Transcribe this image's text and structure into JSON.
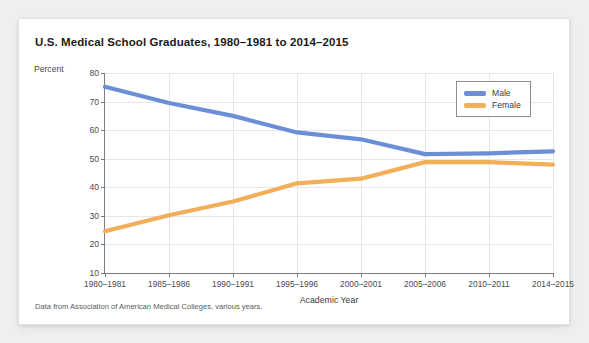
{
  "card": {
    "title": "U.S. Medical School Graduates, 1980–1981 to 2014–2015",
    "source_note": "Data from Association of American Medical Colleges, various years."
  },
  "chart_data": {
    "type": "line",
    "title": "U.S. Medical School Graduates, 1980–1981 to 2014–2015",
    "xlabel": "Academic Year",
    "ylabel": "Percent",
    "categories": [
      "1980–1981",
      "1985–1986",
      "1990–1991",
      "1995–1996",
      "2000–2001",
      "2005–2006",
      "2010–2011",
      "2014–2015"
    ],
    "series": [
      {
        "name": "Male",
        "color": "#6b8ed6",
        "values": [
          75.2,
          69.5,
          65.0,
          59.2,
          56.8,
          51.6,
          51.9,
          52.6
        ]
      },
      {
        "name": "Female",
        "color": "#f2ae58",
        "values": [
          24.6,
          30.2,
          35.0,
          41.4,
          43.0,
          48.8,
          48.8,
          47.9
        ]
      }
    ],
    "ylim": [
      10,
      80
    ],
    "yticks": [
      80,
      70,
      60,
      50,
      40,
      30,
      20,
      10
    ],
    "ytick_labels": [
      "80",
      "70",
      "60",
      "50",
      "40",
      "30",
      "20",
      "10"
    ],
    "grid": true,
    "legend_position": "top-right",
    "legend_entries": [
      "Male",
      "Female"
    ]
  }
}
